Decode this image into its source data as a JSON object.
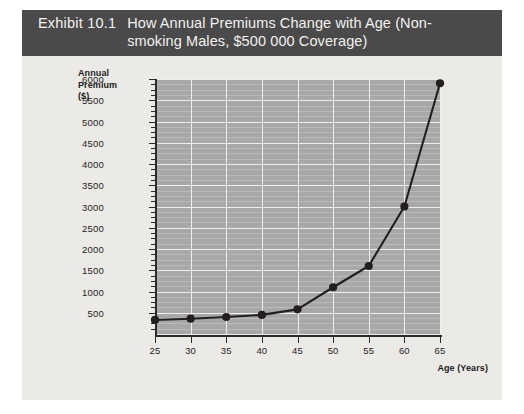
{
  "exhibit": {
    "number": "Exhibit 10.1",
    "title": "How Annual Premiums Change with Age (Non-smoking Males, $500 000 Coverage)"
  },
  "chart_data": {
    "type": "line",
    "title": "How Annual Premiums Change with Age (Non-smoking Males, $500 000 Coverage)",
    "xlabel": "Age (Years)",
    "ylabel": "Annual Premium ($)",
    "x": [
      25,
      30,
      35,
      40,
      45,
      50,
      55,
      60,
      65
    ],
    "values": [
      330,
      360,
      400,
      450,
      580,
      1100,
      1600,
      3000,
      5900
    ],
    "xlim": [
      25,
      65
    ],
    "ylim": [
      0,
      6000
    ],
    "xticks": [
      25,
      30,
      35,
      40,
      45,
      50,
      55,
      60,
      65
    ],
    "yticks": [
      500,
      1000,
      1500,
      2000,
      2500,
      3000,
      3500,
      4000,
      4500,
      5000,
      5500,
      6000
    ],
    "xticklabels": [
      "25",
      "30",
      "35",
      "40",
      "45",
      "50",
      "55",
      "60",
      "65"
    ],
    "yticklabels": [
      "500",
      "1000",
      "1500",
      "2000",
      "2500",
      "3000",
      "3500",
      "4000",
      "4500",
      "5000",
      "5500",
      "6000"
    ],
    "minor_y_divisions": 3,
    "grid": true,
    "legend": false,
    "marker": "circle",
    "series_color": "#231f20",
    "plot_background": "#a8a8a8",
    "gridline_color": "#f0efed"
  },
  "colors": {
    "title_bar": "#4a4a4a",
    "title_text": "#f2f1ef",
    "figure_background": "#eceae7",
    "axis": "#2b2b2b"
  }
}
